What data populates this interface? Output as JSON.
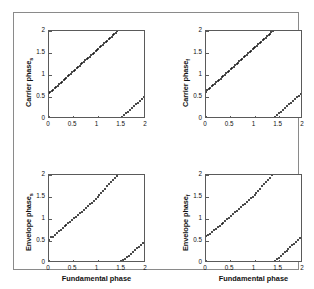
{
  "figure": {
    "background": "#ffffff",
    "border_color": "#8a8a8a",
    "axis_color": "#5a5a5a",
    "marker_color": "#111111"
  },
  "chart_data": [
    {
      "id": "top-left",
      "type": "scatter",
      "title": "",
      "xlabel": "",
      "ylabel": "Carrier phase",
      "ylabel_subscript": "s",
      "xlim": [
        0,
        2
      ],
      "ylim": [
        0,
        2
      ],
      "xticks": [
        0,
        0.5,
        1,
        1.5,
        2
      ],
      "xticklabels": [
        "0",
        "0.5",
        "1",
        "1.5",
        "2"
      ],
      "yticks": [
        0,
        0.5,
        1,
        1.5,
        2
      ],
      "yticklabels": [
        "0",
        "0.5",
        "1",
        "1.5",
        "2"
      ],
      "grid": false,
      "legend": "none",
      "show_xticklabels": true,
      "show_xlabel": false,
      "series": [
        {
          "name": "branch-1",
          "x": [
            0.0,
            0.03,
            0.06,
            0.09,
            0.12,
            0.15,
            0.18,
            0.21,
            0.24,
            0.27,
            0.3,
            0.33,
            0.36,
            0.39,
            0.42,
            0.45,
            0.48,
            0.51,
            0.54,
            0.57,
            0.6,
            0.63,
            0.66,
            0.69,
            0.72,
            0.75,
            0.78,
            0.81,
            0.84,
            0.87,
            0.9,
            0.93,
            0.96,
            0.99,
            1.02,
            1.05,
            1.08,
            1.11,
            1.14,
            1.17,
            1.2,
            1.23,
            1.26,
            1.29,
            1.32,
            1.35,
            1.38,
            1.41
          ],
          "y": [
            0.58,
            0.61,
            0.64,
            0.67,
            0.7,
            0.73,
            0.76,
            0.79,
            0.82,
            0.85,
            0.88,
            0.91,
            0.94,
            0.97,
            1.0,
            1.03,
            1.06,
            1.09,
            1.12,
            1.15,
            1.18,
            1.21,
            1.24,
            1.27,
            1.3,
            1.33,
            1.36,
            1.39,
            1.42,
            1.45,
            1.48,
            1.51,
            1.54,
            1.57,
            1.6,
            1.63,
            1.66,
            1.69,
            1.72,
            1.75,
            1.78,
            1.81,
            1.84,
            1.87,
            1.9,
            1.93,
            1.96,
            1.99
          ]
        },
        {
          "name": "branch-2",
          "x": [
            1.47,
            1.51,
            1.55,
            1.59,
            1.63,
            1.67,
            1.71,
            1.75,
            1.79,
            1.83,
            1.87,
            1.91,
            1.95,
            1.99
          ],
          "y": [
            0.01,
            0.05,
            0.09,
            0.13,
            0.17,
            0.21,
            0.25,
            0.29,
            0.33,
            0.37,
            0.41,
            0.45,
            0.49,
            0.53
          ]
        }
      ]
    },
    {
      "id": "top-right",
      "type": "scatter",
      "title": "",
      "xlabel": "",
      "ylabel": "Carrier phase",
      "ylabel_subscript": "f",
      "xlim": [
        0,
        2
      ],
      "ylim": [
        0,
        2
      ],
      "xticks": [
        0,
        0.5,
        1,
        1.5,
        2
      ],
      "xticklabels": [
        "0",
        "0.5",
        "1",
        "1.5",
        "2"
      ],
      "yticks": [
        0,
        0.5,
        1,
        1.5,
        2
      ],
      "yticklabels": [
        "0",
        "0.5",
        "1",
        "1.5",
        "2"
      ],
      "grid": false,
      "legend": "none",
      "show_xticklabels": true,
      "show_xlabel": false,
      "series": [
        {
          "name": "branch-1",
          "x": [
            0.0,
            0.03,
            0.06,
            0.09,
            0.12,
            0.15,
            0.18,
            0.21,
            0.24,
            0.27,
            0.3,
            0.33,
            0.36,
            0.39,
            0.42,
            0.45,
            0.48,
            0.51,
            0.54,
            0.57,
            0.6,
            0.63,
            0.66,
            0.69,
            0.72,
            0.75,
            0.78,
            0.81,
            0.84,
            0.87,
            0.9,
            0.93,
            0.96,
            0.99,
            1.02,
            1.05,
            1.08,
            1.11,
            1.14,
            1.17,
            1.2,
            1.23,
            1.26,
            1.29,
            1.32,
            1.35,
            1.38
          ],
          "y": [
            0.62,
            0.65,
            0.68,
            0.71,
            0.74,
            0.77,
            0.8,
            0.83,
            0.86,
            0.89,
            0.92,
            0.95,
            0.98,
            1.01,
            1.04,
            1.07,
            1.1,
            1.13,
            1.16,
            1.19,
            1.22,
            1.25,
            1.28,
            1.31,
            1.34,
            1.37,
            1.4,
            1.43,
            1.46,
            1.49,
            1.52,
            1.55,
            1.58,
            1.61,
            1.64,
            1.67,
            1.7,
            1.73,
            1.76,
            1.79,
            1.82,
            1.85,
            1.88,
            1.91,
            1.94,
            1.97,
            2.0
          ]
        },
        {
          "name": "branch-2",
          "x": [
            1.39,
            1.43,
            1.47,
            1.51,
            1.55,
            1.59,
            1.63,
            1.67,
            1.71,
            1.75,
            1.79,
            1.83,
            1.87,
            1.91,
            1.95,
            1.99
          ],
          "y": [
            0.01,
            0.05,
            0.09,
            0.13,
            0.17,
            0.21,
            0.25,
            0.29,
            0.33,
            0.37,
            0.41,
            0.45,
            0.49,
            0.53,
            0.57,
            0.61
          ]
        }
      ]
    },
    {
      "id": "bottom-left",
      "type": "scatter",
      "title": "",
      "xlabel": "Fundamental phase",
      "ylabel": "Envelope phase",
      "ylabel_subscript": "s",
      "xlim": [
        0,
        2
      ],
      "ylim": [
        0,
        2
      ],
      "xticks": [
        0,
        0.5,
        1,
        1.5,
        2
      ],
      "xticklabels": [
        "0",
        "0.5",
        "1",
        "1.5",
        "2"
      ],
      "yticks": [
        0,
        0.5,
        1,
        1.5,
        2
      ],
      "yticklabels": [
        "0",
        "0.5",
        "1",
        "1.5",
        "2"
      ],
      "grid": false,
      "legend": "none",
      "show_xticklabels": true,
      "show_xlabel": true,
      "series": [
        {
          "name": "branch-1",
          "x": [
            0.0,
            0.04,
            0.08,
            0.12,
            0.16,
            0.2,
            0.24,
            0.28,
            0.32,
            0.36,
            0.4,
            0.44,
            0.48,
            0.52,
            0.56,
            0.6,
            0.64,
            0.68,
            0.72,
            0.76,
            0.8,
            0.84,
            0.88,
            0.92,
            0.96,
            1.0,
            1.04,
            1.08,
            1.12,
            1.16,
            1.2,
            1.24,
            1.28,
            1.32,
            1.36,
            1.4
          ],
          "y": [
            0.53,
            0.58,
            0.6,
            0.64,
            0.69,
            0.72,
            0.75,
            0.8,
            0.83,
            0.86,
            0.91,
            0.94,
            0.98,
            1.02,
            1.05,
            1.1,
            1.13,
            1.17,
            1.21,
            1.25,
            1.29,
            1.33,
            1.37,
            1.41,
            1.46,
            1.5,
            1.55,
            1.59,
            1.64,
            1.69,
            1.74,
            1.79,
            1.84,
            1.89,
            1.94,
            1.98
          ]
        },
        {
          "name": "branch-2",
          "x": [
            1.44,
            1.49,
            1.53,
            1.57,
            1.61,
            1.65,
            1.69,
            1.73,
            1.77,
            1.81,
            1.85,
            1.89,
            1.93,
            1.97
          ],
          "y": [
            0.02,
            0.04,
            0.07,
            0.1,
            0.14,
            0.17,
            0.21,
            0.25,
            0.29,
            0.33,
            0.37,
            0.41,
            0.45,
            0.5
          ]
        }
      ]
    },
    {
      "id": "bottom-right",
      "type": "scatter",
      "title": "",
      "xlabel": "Fundamental phase",
      "ylabel": "Envelope phase",
      "ylabel_subscript": "f",
      "xlim": [
        0,
        2
      ],
      "ylim": [
        0,
        2
      ],
      "xticks": [
        0,
        0.5,
        1,
        1.5,
        2
      ],
      "xticklabels": [
        "0",
        "0.5",
        "1",
        "1.5",
        "2"
      ],
      "yticks": [
        0,
        0.5,
        1,
        1.5,
        2
      ],
      "yticklabels": [
        "0",
        "0.5",
        "1",
        "1.5",
        "2"
      ],
      "grid": false,
      "legend": "none",
      "show_xticklabels": true,
      "show_xlabel": true,
      "series": [
        {
          "name": "branch-1",
          "x": [
            0.0,
            0.04,
            0.08,
            0.12,
            0.16,
            0.2,
            0.24,
            0.28,
            0.32,
            0.36,
            0.4,
            0.44,
            0.48,
            0.52,
            0.56,
            0.6,
            0.64,
            0.68,
            0.72,
            0.76,
            0.8,
            0.84,
            0.88,
            0.92,
            0.96,
            1.0,
            1.04,
            1.08,
            1.12,
            1.16,
            1.2,
            1.24,
            1.28,
            1.32,
            1.36
          ],
          "y": [
            0.61,
            0.64,
            0.67,
            0.7,
            0.74,
            0.77,
            0.81,
            0.85,
            0.88,
            0.92,
            0.96,
            1.0,
            1.03,
            1.07,
            1.11,
            1.15,
            1.19,
            1.23,
            1.27,
            1.31,
            1.35,
            1.39,
            1.43,
            1.47,
            1.51,
            1.55,
            1.6,
            1.64,
            1.69,
            1.74,
            1.79,
            1.84,
            1.89,
            1.94,
            1.99
          ]
        },
        {
          "name": "branch-2",
          "x": [
            1.38,
            1.42,
            1.46,
            1.5,
            1.54,
            1.58,
            1.62,
            1.66,
            1.7,
            1.74,
            1.78,
            1.82,
            1.86,
            1.9,
            1.94,
            1.98
          ],
          "y": [
            0.01,
            0.04,
            0.08,
            0.12,
            0.16,
            0.2,
            0.24,
            0.28,
            0.32,
            0.36,
            0.4,
            0.44,
            0.48,
            0.52,
            0.56,
            0.6
          ]
        }
      ]
    }
  ]
}
